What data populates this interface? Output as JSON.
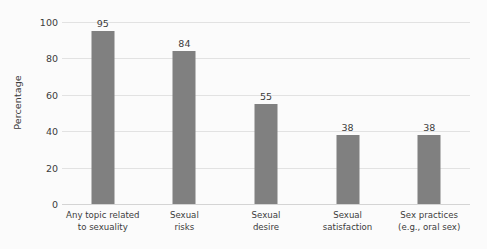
{
  "chart_data": {
    "type": "bar",
    "title": "",
    "subtitle": "",
    "xlabel": "",
    "ylabel": "Percentage",
    "ylim": [
      0,
      100
    ],
    "yticks": [
      0,
      20,
      40,
      60,
      80,
      100
    ],
    "ytick_labels": [
      "0",
      "20",
      "40",
      "60",
      "80",
      "100"
    ],
    "grid": "horizontal",
    "legend": "none",
    "bar_color": "#808080",
    "gridline_color": "#e2e2e2",
    "text_color": "#3c3c3c",
    "background_color": "#fbfbfb",
    "show_value_labels": true,
    "categories": [
      "Any topic related to sexuality",
      "Sexual risks",
      "Sexual desire",
      "Sexual satisfaction",
      "Sex practices (e.g., oral sex)"
    ],
    "category_lines": [
      [
        "Any topic related",
        "to sexuality"
      ],
      [
        "Sexual",
        "risks"
      ],
      [
        "Sexual",
        "desire"
      ],
      [
        "Sexual",
        "satisfaction"
      ],
      [
        "Sex practices",
        "(e.g., oral sex)"
      ]
    ],
    "values": [
      95,
      84,
      55,
      38,
      38
    ],
    "value_labels": [
      "95",
      "84",
      "55",
      "38",
      "38"
    ]
  }
}
